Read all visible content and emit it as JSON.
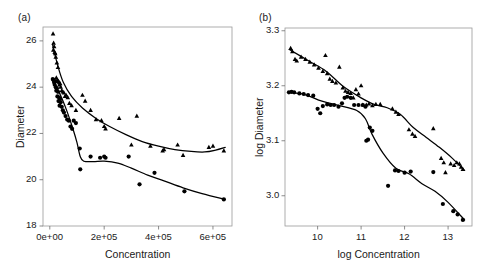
{
  "figure": {
    "background": "#ffffff",
    "ink": "#000000",
    "axis_color": "#9a9a9a"
  },
  "chart_data": [
    {
      "type": "scatter",
      "panel_label": "(a)",
      "title": "",
      "xlabel": "Concentration",
      "ylabel": "Diameter",
      "xlim": [
        -25000,
        670000
      ],
      "ylim": [
        18,
        26.6
      ],
      "xticks": [
        0,
        200000,
        400000,
        600000
      ],
      "xticklabels": [
        "0e+00",
        "2e+05",
        "4e+05",
        "6e+05"
      ],
      "yticks": [
        18,
        20,
        22,
        24,
        26
      ],
      "yticklabels": [
        "18",
        "20",
        "22",
        "24",
        "26"
      ],
      "grid": false,
      "legend": "none",
      "series": [
        {
          "name": "triangles",
          "marker": "triangle",
          "points": [
            [
              12000,
              26.3
            ],
            [
              14000,
              25.9
            ],
            [
              16000,
              25.75
            ],
            [
              13000,
              25.6
            ],
            [
              18000,
              25.5
            ],
            [
              20000,
              25.45
            ],
            [
              22000,
              25.3
            ],
            [
              26000,
              25.05
            ],
            [
              30000,
              24.85
            ],
            [
              24000,
              24.4
            ],
            [
              28000,
              24.3
            ],
            [
              32000,
              24.25
            ],
            [
              34000,
              24.2
            ],
            [
              36000,
              24.1
            ],
            [
              38000,
              24.15
            ],
            [
              40000,
              24.0
            ],
            [
              44000,
              23.85
            ],
            [
              48000,
              23.8
            ],
            [
              52000,
              23.75
            ],
            [
              56000,
              23.6
            ],
            [
              60000,
              23.65
            ],
            [
              66000,
              23.55
            ],
            [
              72000,
              23.3
            ],
            [
              80000,
              23.2
            ],
            [
              96000,
              23.0
            ],
            [
              120000,
              23.65
            ],
            [
              130000,
              23.4
            ],
            [
              150000,
              23.0
            ],
            [
              170000,
              22.6
            ],
            [
              190000,
              22.55
            ],
            [
              200000,
              22.3
            ],
            [
              205000,
              22.2
            ],
            [
              255000,
              22.65
            ],
            [
              300000,
              21.5
            ],
            [
              320000,
              22.75
            ],
            [
              370000,
              21.45
            ],
            [
              415000,
              21.25
            ],
            [
              420000,
              21.3
            ],
            [
              470000,
              21.5
            ],
            [
              490000,
              21.05
            ],
            [
              585000,
              21.4
            ],
            [
              600000,
              21.45
            ],
            [
              640000,
              21.25
            ]
          ],
          "fit": [
            [
              10000,
              25.85
            ],
            [
              30000,
              24.9
            ],
            [
              50000,
              24.2
            ],
            [
              80000,
              23.6
            ],
            [
              120000,
              23.1
            ],
            [
              170000,
              22.65
            ],
            [
              220000,
              22.3
            ],
            [
              280000,
              21.95
            ],
            [
              340000,
              21.65
            ],
            [
              400000,
              21.45
            ],
            [
              460000,
              21.3
            ],
            [
              520000,
              21.22
            ],
            [
              570000,
              21.2
            ],
            [
              610000,
              21.28
            ],
            [
              645000,
              21.4
            ]
          ]
        },
        {
          "name": "circles",
          "marker": "circle",
          "points": [
            [
              11000,
              24.35
            ],
            [
              14000,
              24.3
            ],
            [
              16000,
              24.2
            ],
            [
              20000,
              24.25
            ],
            [
              18000,
              24.1
            ],
            [
              22000,
              24.0
            ],
            [
              26000,
              23.95
            ],
            [
              24000,
              23.85
            ],
            [
              30000,
              23.8
            ],
            [
              28000,
              23.6
            ],
            [
              34000,
              23.55
            ],
            [
              38000,
              23.5
            ],
            [
              32000,
              23.4
            ],
            [
              40000,
              23.35
            ],
            [
              36000,
              23.2
            ],
            [
              44000,
              23.15
            ],
            [
              48000,
              23.0
            ],
            [
              52000,
              22.9
            ],
            [
              58000,
              22.75
            ],
            [
              64000,
              22.6
            ],
            [
              70000,
              22.55
            ],
            [
              76000,
              22.3
            ],
            [
              82000,
              22.2
            ],
            [
              88000,
              22.55
            ],
            [
              96000,
              22.45
            ],
            [
              110000,
              21.35
            ],
            [
              112000,
              20.45
            ],
            [
              150000,
              21.0
            ],
            [
              185000,
              20.95
            ],
            [
              200000,
              21.0
            ],
            [
              205000,
              20.95
            ],
            [
              290000,
              21.0
            ],
            [
              330000,
              19.8
            ],
            [
              385000,
              20.3
            ],
            [
              495000,
              19.5
            ],
            [
              640000,
              19.15
            ]
          ],
          "fit": [
            [
              10000,
              24.3
            ],
            [
              25000,
              24.0
            ],
            [
              45000,
              23.5
            ],
            [
              65000,
              22.9
            ],
            [
              85000,
              22.2
            ],
            [
              100000,
              21.6
            ],
            [
              112000,
              21.0
            ],
            [
              125000,
              20.8
            ],
            [
              160000,
              20.78
            ],
            [
              200000,
              20.8
            ],
            [
              250000,
              20.72
            ],
            [
              300000,
              20.5
            ],
            [
              360000,
              20.2
            ],
            [
              420000,
              19.95
            ],
            [
              490000,
              19.65
            ],
            [
              560000,
              19.4
            ],
            [
              645000,
              19.15
            ]
          ]
        }
      ]
    },
    {
      "type": "scatter",
      "panel_label": "(b)",
      "title": "",
      "xlabel": "log Concentration",
      "ylabel": "log Diameter",
      "xlim": [
        9.25,
        13.55
      ],
      "ylim": [
        2.945,
        3.305
      ],
      "xticks": [
        10,
        11,
        12,
        13
      ],
      "xticklabels": [
        "10",
        "11",
        "12",
        "13"
      ],
      "yticks": [
        3.0,
        3.1,
        3.2,
        3.3
      ],
      "yticklabels": [
        "3.0",
        "3.1",
        "3.2",
        "3.3"
      ],
      "grid": false,
      "legend": "none",
      "series": [
        {
          "name": "triangles",
          "marker": "triangle",
          "points": [
            [
              9.38,
              3.268
            ],
            [
              9.42,
              3.262
            ],
            [
              9.48,
              3.248
            ],
            [
              9.52,
              3.245
            ],
            [
              9.62,
              3.252
            ],
            [
              9.72,
              3.248
            ],
            [
              9.82,
              3.243
            ],
            [
              9.92,
              3.238
            ],
            [
              10.02,
              3.232
            ],
            [
              10.12,
              3.226
            ],
            [
              10.18,
              3.255
            ],
            [
              10.22,
              3.222
            ],
            [
              10.28,
              3.212
            ],
            [
              10.34,
              3.208
            ],
            [
              10.42,
              3.205
            ],
            [
              10.5,
              3.234
            ],
            [
              10.58,
              3.196
            ],
            [
              10.64,
              3.19
            ],
            [
              10.7,
              3.188
            ],
            [
              10.76,
              3.186
            ],
            [
              10.82,
              3.178
            ],
            [
              10.88,
              3.193
            ],
            [
              10.94,
              3.185
            ],
            [
              11.0,
              3.2
            ],
            [
              11.04,
              3.165
            ],
            [
              11.12,
              3.165
            ],
            [
              11.18,
              3.167
            ],
            [
              11.26,
              3.164
            ],
            [
              11.34,
              3.166
            ],
            [
              11.44,
              3.166
            ],
            [
              11.72,
              3.158
            ],
            [
              11.8,
              3.152
            ],
            [
              11.86,
              3.148
            ],
            [
              12.1,
              3.12
            ],
            [
              12.18,
              3.112
            ],
            [
              12.24,
              3.108
            ],
            [
              12.66,
              3.122
            ],
            [
              12.84,
              3.068
            ],
            [
              12.9,
              3.06
            ],
            [
              12.94,
              3.042
            ],
            [
              13.06,
              3.058
            ],
            [
              13.14,
              3.055
            ],
            [
              13.2,
              3.06
            ],
            [
              13.26,
              3.058
            ],
            [
              13.3,
              3.052
            ],
            [
              13.34,
              3.048
            ]
          ],
          "fit": [
            [
              9.35,
              3.266
            ],
            [
              9.8,
              3.245
            ],
            [
              10.2,
              3.226
            ],
            [
              10.6,
              3.198
            ],
            [
              11.0,
              3.178
            ],
            [
              11.3,
              3.166
            ],
            [
              11.6,
              3.16
            ],
            [
              11.9,
              3.148
            ],
            [
              12.2,
              3.124
            ],
            [
              12.5,
              3.106
            ],
            [
              12.8,
              3.088
            ],
            [
              13.1,
              3.068
            ],
            [
              13.38,
              3.046
            ]
          ]
        },
        {
          "name": "circles",
          "marker": "circle",
          "points": [
            [
              9.34,
              3.188
            ],
            [
              9.4,
              3.189
            ],
            [
              9.46,
              3.188
            ],
            [
              9.58,
              3.186
            ],
            [
              9.68,
              3.185
            ],
            [
              9.78,
              3.183
            ],
            [
              9.9,
              3.182
            ],
            [
              10.0,
              3.158
            ],
            [
              10.06,
              3.15
            ],
            [
              10.12,
              3.163
            ],
            [
              10.22,
              3.166
            ],
            [
              10.3,
              3.165
            ],
            [
              10.38,
              3.165
            ],
            [
              10.48,
              3.162
            ],
            [
              10.56,
              3.168
            ],
            [
              10.62,
              3.178
            ],
            [
              10.68,
              3.18
            ],
            [
              10.76,
              3.178
            ],
            [
              10.84,
              3.165
            ],
            [
              10.94,
              3.165
            ],
            [
              11.04,
              3.165
            ],
            [
              11.1,
              3.162
            ],
            [
              11.12,
              3.1
            ],
            [
              11.16,
              3.102
            ],
            [
              11.2,
              3.124
            ],
            [
              11.26,
              3.118
            ],
            [
              11.62,
              3.018
            ],
            [
              11.78,
              3.046
            ],
            [
              11.86,
              3.045
            ],
            [
              12.0,
              3.042
            ],
            [
              12.14,
              3.044
            ],
            [
              12.66,
              3.043
            ],
            [
              12.88,
              2.985
            ],
            [
              13.12,
              2.972
            ],
            [
              13.22,
              2.966
            ],
            [
              13.34,
              2.956
            ]
          ],
          "fit": [
            [
              9.32,
              3.188
            ],
            [
              9.7,
              3.184
            ],
            [
              10.1,
              3.172
            ],
            [
              10.5,
              3.164
            ],
            [
              10.9,
              3.155
            ],
            [
              11.1,
              3.14
            ],
            [
              11.25,
              3.112
            ],
            [
              11.5,
              3.078
            ],
            [
              11.8,
              3.05
            ],
            [
              12.1,
              3.04
            ],
            [
              12.4,
              3.022
            ],
            [
              12.7,
              3.008
            ],
            [
              13.0,
              2.988
            ],
            [
              13.38,
              2.956
            ]
          ]
        }
      ]
    }
  ]
}
